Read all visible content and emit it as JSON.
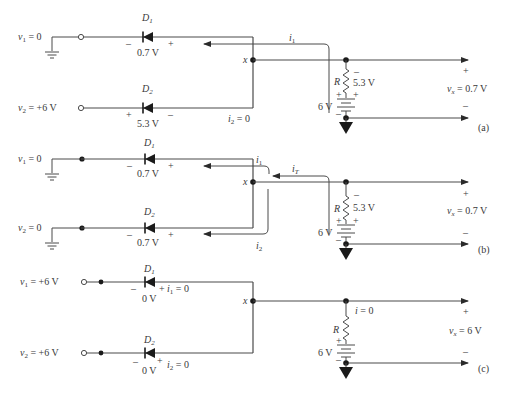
{
  "figure": {
    "panels": [
      {
        "id": "a",
        "label": "(a)",
        "v1": {
          "name": "v",
          "sub": "1",
          "value": " = 0",
          "source": "ground"
        },
        "v2": {
          "name": "v",
          "sub": "2",
          "value": " = +6 V",
          "source": "open"
        },
        "d1": {
          "name": "D",
          "sub": "1",
          "voltage": "0.7 V",
          "left_sign": "–",
          "right_sign": "+"
        },
        "d2": {
          "name": "D",
          "sub": "2",
          "voltage": "5.3 V",
          "left_sign": "+",
          "right_sign": "–"
        },
        "node": "x",
        "currents": [
          {
            "name": "i",
            "sub": "1",
            "text": ""
          },
          {
            "name": "i",
            "sub": "2",
            "text": " = 0"
          }
        ],
        "resistor": {
          "name": "R",
          "voltage": "5.3 V",
          "top_sign": "–",
          "bottom_sign": "+"
        },
        "battery": {
          "value": "6 V",
          "plus": "+",
          "minus": "–"
        },
        "output": {
          "name": "v",
          "sub": "x",
          "value": " = 0.7 V",
          "plus": "+",
          "minus": "–"
        }
      },
      {
        "id": "b",
        "label": "(b)",
        "v1": {
          "name": "v",
          "sub": "1",
          "value": " = 0",
          "source": "ground"
        },
        "v2": {
          "name": "v",
          "sub": "2",
          "value": " = 0",
          "source": "ground"
        },
        "d1": {
          "name": "D",
          "sub": "1",
          "voltage": "0.7 V",
          "left_sign": "–",
          "right_sign": "+"
        },
        "d2": {
          "name": "D",
          "sub": "2",
          "voltage": "0.7 V",
          "left_sign": "–",
          "right_sign": "+"
        },
        "node": "x",
        "currents": [
          {
            "name": "i",
            "sub": "1",
            "text": ""
          },
          {
            "name": "i",
            "sub": "2",
            "text": ""
          },
          {
            "name": "i",
            "sub": "T",
            "text": ""
          }
        ],
        "resistor": {
          "name": "R",
          "voltage": "5.3 V",
          "top_sign": "–",
          "bottom_sign": "+"
        },
        "battery": {
          "value": "6 V",
          "plus": "+",
          "minus": "–"
        },
        "output": {
          "name": "v",
          "sub": "x",
          "value": " = 0.7 V",
          "plus": "+",
          "minus": "–"
        }
      },
      {
        "id": "c",
        "label": "(c)",
        "v1": {
          "name": "v",
          "sub": "1",
          "value": " = +6 V",
          "source": "open"
        },
        "v2": {
          "name": "v",
          "sub": "2",
          "value": " = +6 V",
          "source": "open"
        },
        "d1": {
          "name": "D",
          "sub": "1",
          "voltage": "0 V",
          "left_sign": "–",
          "right_sign": "+",
          "current": "i",
          "current_sub": "1",
          "current_text": " = 0"
        },
        "d2": {
          "name": "D",
          "sub": "2",
          "voltage": "0 V",
          "left_sign": "–",
          "right_sign": "+",
          "current": "i",
          "current_sub": "2",
          "current_text": " = 0"
        },
        "node": "x",
        "currents": [
          {
            "name": "i",
            "sub": "",
            "text": " = 0"
          }
        ],
        "resistor": {
          "name": "R",
          "voltage": "",
          "top_sign": "",
          "bottom_sign": "+"
        },
        "battery": {
          "value": "6 V",
          "plus": "+",
          "minus": "–"
        },
        "output": {
          "name": "v",
          "sub": "x",
          "value": " = 6 V",
          "plus": "+",
          "minus": "–"
        }
      }
    ]
  }
}
